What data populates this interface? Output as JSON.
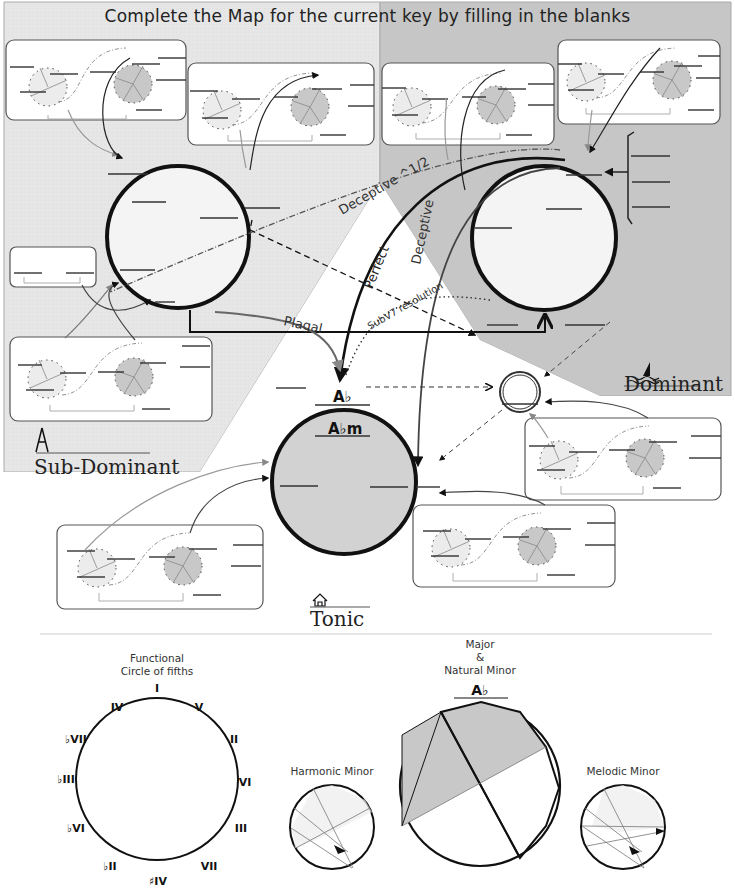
{
  "title": "Complete the Map for the current  key by filling in the blanks",
  "key": {
    "tonic_major": "A♭",
    "tonic_minor": "A♭m"
  },
  "regions": {
    "sub_dominant": {
      "label": "Sub-Dominant",
      "icon": "compass-icon"
    },
    "dominant": {
      "label": "Dominant",
      "icon": "sailboat-icon"
    },
    "tonic": {
      "label": "Tonic",
      "icon": "house-icon"
    }
  },
  "cadences": {
    "deceptive_half": "Deceptive ^1/2",
    "perfect": "Perfect",
    "deceptive": "Deceptive",
    "plagal": "Plagal",
    "subv7": "SubV7 resolution"
  },
  "colors": {
    "subdominant_bg": "#e4e4e4",
    "dominant_bg": "#c4c4c4",
    "tonic_fill": "#d0d0d0",
    "panel_bg": "#ffffff",
    "line": "#111111"
  },
  "bottom": {
    "circle_of_fifths": {
      "title_line1": "Functional",
      "title_line2": "Circle of fifths",
      "labels": [
        "I",
        "V",
        "II",
        "VI",
        "III",
        "VII",
        "♯IV",
        "♭II",
        "♭VI",
        "♭III",
        "♭VII",
        "IV"
      ]
    },
    "harmonic_minor": {
      "title": "Harmonic Minor"
    },
    "major_natural_minor": {
      "title_line1": "Major",
      "title_line2": "&",
      "title_line3": "Natural Minor",
      "key": "A♭"
    },
    "melodic_minor": {
      "title": "Melodic Minor"
    }
  }
}
